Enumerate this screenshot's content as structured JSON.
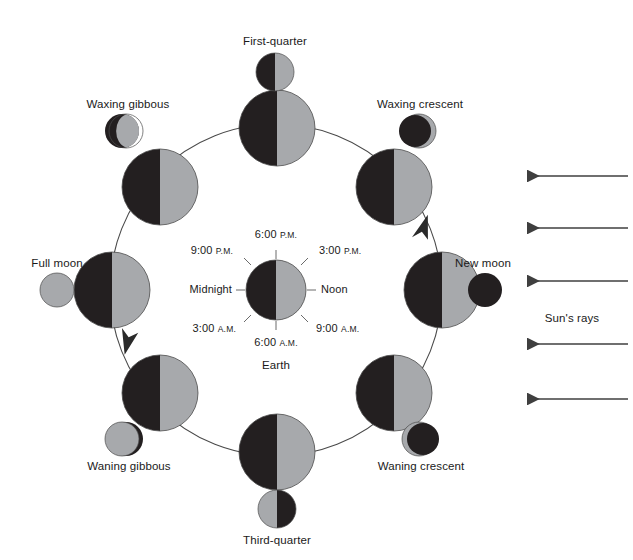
{
  "figure": {
    "type": "astronomy-diagram",
    "colors": {
      "dark_side": "#231f20",
      "lit_side": "#a7a9ac",
      "line": "#3f3f3f",
      "text": "#1a1a1a",
      "background": "#ffffff"
    }
  },
  "center": {
    "body_label": "Earth",
    "time_labels": {
      "top": {
        "time": "6:00",
        "period": "P.M."
      },
      "top_right": {
        "time": "3:00",
        "period": "P.M."
      },
      "right": {
        "time": "Noon",
        "period": ""
      },
      "bottom_right": {
        "time": "9:00",
        "period": "A.M."
      },
      "bottom": {
        "time": "6:00",
        "period": "A.M."
      },
      "bottom_left": {
        "time": "3:00",
        "period": "A.M."
      },
      "left": {
        "time": "Midnight",
        "period": ""
      },
      "top_left": {
        "time": "9:00",
        "period": "P.M."
      }
    }
  },
  "sun": {
    "rays_label": "Sun's rays",
    "ray_count": 5,
    "direction": "leftward",
    "ray_y_positions": [
      176,
      228,
      281,
      344,
      399
    ]
  },
  "orbit": {
    "direction": "counterclockwise",
    "arrow_count": 2
  },
  "phases": [
    {
      "name": "First-quarter",
      "label": "First-quarter",
      "orbit_position": "top",
      "orbit_angle_deg": 270,
      "seen_from_earth": "right-half-lit",
      "icon_lit_side": "right",
      "icon_kind": "half",
      "label_pos": "above"
    },
    {
      "name": "Waxing gibbous",
      "label": "Waxing gibbous",
      "orbit_position": "upper-left",
      "orbit_angle_deg": 225,
      "seen_from_earth": "gibbous-lit-right",
      "icon_lit_side": "right",
      "icon_kind": "gibbous",
      "label_pos": "above"
    },
    {
      "name": "Full moon",
      "label": "Full moon",
      "orbit_position": "left",
      "orbit_angle_deg": 180,
      "seen_from_earth": "fully-lit",
      "icon_lit_side": "all",
      "icon_kind": "full",
      "label_pos": "above"
    },
    {
      "name": "Waning gibbous",
      "label": "Waning gibbous",
      "orbit_position": "lower-left",
      "orbit_angle_deg": 135,
      "seen_from_earth": "gibbous-lit-left",
      "icon_lit_side": "left",
      "icon_kind": "gibbous",
      "label_pos": "below"
    },
    {
      "name": "Third-quarter",
      "label": "Third-quarter",
      "orbit_position": "bottom",
      "orbit_angle_deg": 90,
      "seen_from_earth": "left-half-lit",
      "icon_lit_side": "left",
      "icon_kind": "half",
      "label_pos": "below"
    },
    {
      "name": "Waning crescent",
      "label": "Waning crescent",
      "orbit_position": "lower-right",
      "orbit_angle_deg": 45,
      "seen_from_earth": "crescent-lit-left",
      "icon_lit_side": "left",
      "icon_kind": "crescent",
      "label_pos": "below"
    },
    {
      "name": "New moon",
      "label": "New moon",
      "orbit_position": "right",
      "orbit_angle_deg": 0,
      "seen_from_earth": "unlit",
      "icon_lit_side": "none",
      "icon_kind": "new",
      "label_pos": "above"
    },
    {
      "name": "Waxing crescent",
      "label": "Waxing crescent",
      "orbit_position": "upper-right",
      "orbit_angle_deg": 315,
      "seen_from_earth": "crescent-lit-right",
      "icon_lit_side": "right",
      "icon_kind": "crescent",
      "label_pos": "above"
    }
  ]
}
